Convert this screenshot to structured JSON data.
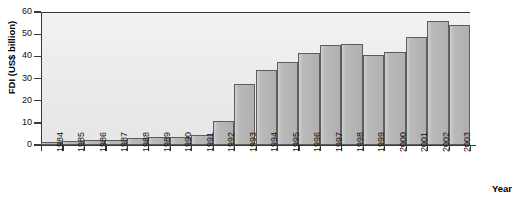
{
  "chart_data": {
    "type": "bar",
    "title": "",
    "xlabel": "Year",
    "ylabel": "FDI (US$ billion)",
    "ylim": [
      0,
      60
    ],
    "yticks": [
      0,
      10,
      20,
      30,
      40,
      50,
      60
    ],
    "grid": false,
    "legend": null,
    "categories": [
      "1984",
      "1985",
      "1986",
      "1987",
      "1988",
      "1989",
      "1990",
      "1991",
      "1992",
      "1993",
      "1994",
      "1995",
      "1996",
      "1997",
      "1998",
      "1999",
      "2000",
      "2001",
      "2002",
      "2003"
    ],
    "values": [
      1.4,
      2.0,
      2.2,
      2.3,
      3.2,
      3.4,
      3.5,
      4.4,
      11.0,
      27.5,
      33.8,
      37.5,
      41.7,
      45.3,
      45.5,
      40.4,
      42.1,
      48.8,
      55.8,
      54.0
    ],
    "bar_color": "#b9b9b9",
    "bar_border_color": "#5d5d5d",
    "plot_bg_color": "#ededed",
    "axis_color": "#3a3a3a"
  },
  "axis": {
    "y_title": "FDI (US$ billion)",
    "x_title": "Year"
  }
}
